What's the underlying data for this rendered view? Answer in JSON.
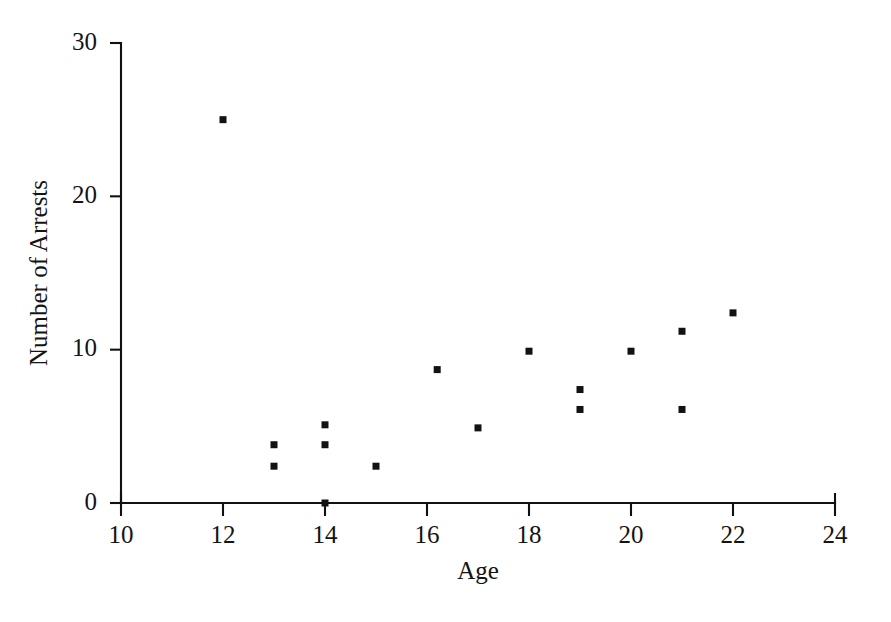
{
  "chart_data": {
    "type": "scatter",
    "title": "",
    "xlabel": "Age",
    "ylabel": "Number of Arrests",
    "xlim": [
      10,
      24
    ],
    "ylim": [
      0,
      30
    ],
    "xticks": [
      10,
      12,
      14,
      16,
      18,
      20,
      22,
      24
    ],
    "yticks": [
      0,
      10,
      20,
      30
    ],
    "xtick_labels": [
      "10",
      "12",
      "14",
      "16",
      "18",
      "20",
      "22",
      "24"
    ],
    "ytick_labels": [
      "0",
      "10",
      "20",
      "30"
    ],
    "grid": false,
    "legend": null,
    "marker": "square",
    "marker_color": "#121212",
    "points": [
      {
        "x": 12,
        "y": 25.0
      },
      {
        "x": 13,
        "y": 3.8
      },
      {
        "x": 13,
        "y": 2.4
      },
      {
        "x": 14,
        "y": 5.1
      },
      {
        "x": 14,
        "y": 3.8
      },
      {
        "x": 14,
        "y": 0.0
      },
      {
        "x": 15,
        "y": 2.4
      },
      {
        "x": 16.2,
        "y": 8.7
      },
      {
        "x": 17,
        "y": 4.9
      },
      {
        "x": 18,
        "y": 9.9
      },
      {
        "x": 19,
        "y": 7.4
      },
      {
        "x": 19,
        "y": 6.1
      },
      {
        "x": 20,
        "y": 9.9
      },
      {
        "x": 21,
        "y": 11.2
      },
      {
        "x": 21,
        "y": 6.1
      },
      {
        "x": 22,
        "y": 12.4
      }
    ]
  },
  "colors": {
    "axis": "#111111",
    "text": "#141414",
    "marker": "#121212",
    "background": "#ffffff"
  }
}
